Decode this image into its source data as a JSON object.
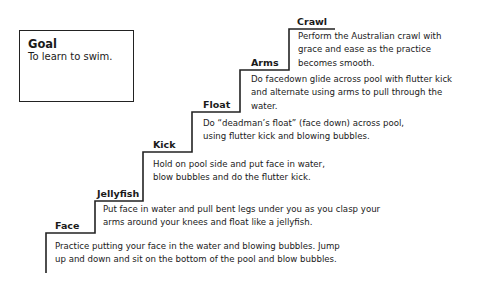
{
  "goal": {
    "title": "Goal",
    "text": "To learn to swim."
  },
  "steps": [
    {
      "label": "Face",
      "lines": [
        "Practice putting your face in the water and blowing bubbles. Jump",
        "up and down and sit on the bottom of the pool and blow bubbles."
      ]
    },
    {
      "label": "Jellyfish",
      "lines": [
        "Put face in water and pull bent legs under you as you clasp your",
        "arms around your knees and float like a jellyfish."
      ]
    },
    {
      "label": "Kick",
      "lines": [
        "Hold on pool side and put face in water,",
        "blow bubbles and do the flutter kick."
      ]
    },
    {
      "label": "Float",
      "lines": [
        "Do “deadman’s float” (face down) across pool,",
        "using flutter kick and blowing bubbles."
      ]
    },
    {
      "label": "Arms",
      "lines": [
        "Do facedown glide across pool with flutter kick",
        "and alternate using arms to pull through the",
        "water."
      ]
    },
    {
      "label": "Crawl",
      "lines": [
        "Perform the Australian crawl with",
        "grace and ease as the practice",
        "becomes smooth."
      ]
    }
  ],
  "colors": {
    "line": "#222222",
    "text": "#1a1a1a",
    "background": "#ffffff"
  }
}
